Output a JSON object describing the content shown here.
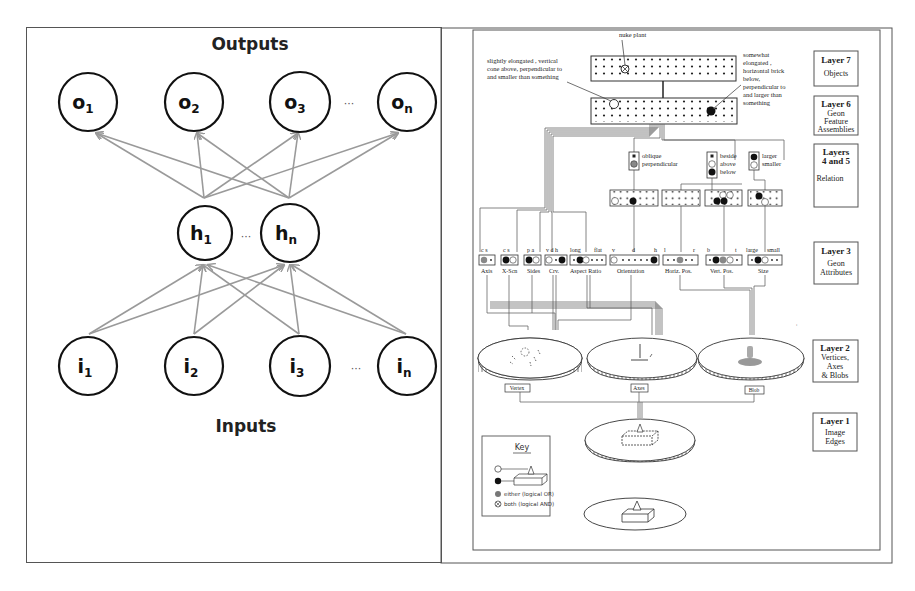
{
  "left_figure": {
    "title_top": "Outputs",
    "title_bottom": "Inputs",
    "ellipsis": "···",
    "output_nodes": [
      {
        "base": "o",
        "sub": "1"
      },
      {
        "base": "o",
        "sub": "2"
      },
      {
        "base": "o",
        "sub": "3"
      },
      {
        "base": "o",
        "sub": "n"
      }
    ],
    "hidden_nodes": [
      {
        "base": "h",
        "sub": "1"
      },
      {
        "base": "h",
        "sub": "n"
      }
    ],
    "input_nodes": [
      {
        "base": "i",
        "sub": "1"
      },
      {
        "base": "i",
        "sub": "2"
      },
      {
        "base": "i",
        "sub": "3"
      },
      {
        "base": "i",
        "sub": "n"
      }
    ],
    "edge_color": "#9a9a9a",
    "node_stroke": "#111111"
  },
  "right_figure": {
    "annotations": {
      "nuke_plant": "nuke plant",
      "left_note": [
        "slightly elongated , vertical",
        "cone above, perpendicular to",
        "and smaller than something"
      ],
      "right_note": [
        "somewhat",
        "elongated ,",
        "horizontal brick",
        "below,",
        "perpendicular to",
        "and larger than",
        "something"
      ]
    },
    "layers": [
      {
        "title": "Layer 7",
        "desc": [
          "Objects"
        ]
      },
      {
        "title": "Layer 6",
        "desc": [
          "Geon",
          "Feature",
          "Assemblies"
        ]
      },
      {
        "title": "Layers",
        "title2": "4 and 5",
        "desc": [
          "Relation"
        ]
      },
      {
        "title": "Layer 3",
        "desc": [
          "Geon",
          "Attributes"
        ]
      },
      {
        "title": "Layer 2",
        "desc": [
          "Vertices,",
          "Axes",
          "& Blobs"
        ]
      },
      {
        "title": "Layer 1",
        "desc": [
          "Image",
          "Edges"
        ]
      }
    ],
    "relations": [
      {
        "labels": [
          "oblique",
          "perpendicular"
        ]
      },
      {
        "labels": [
          "beside",
          "above",
          "below"
        ]
      },
      {
        "labels": [
          "larger",
          "smaller"
        ]
      }
    ],
    "geon_attributes": [
      {
        "name": "Axis",
        "ticks": [
          "c",
          "s"
        ]
      },
      {
        "name": "X-Scn",
        "ticks": [
          "c",
          "s"
        ]
      },
      {
        "name": "Sides",
        "ticks": [
          "p",
          "a"
        ]
      },
      {
        "name": "Crv.",
        "ticks": [
          "v",
          "d",
          "h"
        ]
      },
      {
        "name": "Aspect Ratio",
        "ticks": [
          "long",
          "flat"
        ]
      },
      {
        "name": "Orientation",
        "ticks": [
          "v",
          "d",
          "h"
        ]
      },
      {
        "name": "Horiz. Pos.",
        "ticks": [
          "l",
          "r"
        ]
      },
      {
        "name": "Vert. Pos.",
        "ticks": [
          "b",
          "t"
        ]
      },
      {
        "name": "Size",
        "ticks": [
          "large",
          "small"
        ]
      }
    ],
    "layer2_maps": [
      "Vertex",
      "Axes",
      "Blob"
    ],
    "key": {
      "title": "Key",
      "items": [
        "either (logical OR)",
        "both (logical AND)"
      ]
    }
  }
}
